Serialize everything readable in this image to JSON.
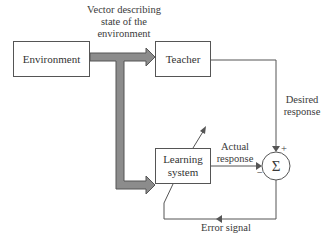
{
  "diagram": {
    "type": "block diagram",
    "blocks": {
      "environment": "Environment",
      "teacher": "Teacher",
      "learning_system_line1": "Learning",
      "learning_system_line2": "system",
      "summing_junction": "Σ"
    },
    "labels": {
      "vector_line1": "Vector describing",
      "vector_line2": "state of the",
      "vector_line3": "environment",
      "desired_line1": "Desired",
      "desired_line2": "response",
      "actual_line1": "Actual",
      "actual_line2": "response",
      "error_signal": "Error signal",
      "plus_sign": "+",
      "minus_sign": "−"
    },
    "colors": {
      "thick_arrow_fill": "#8c8c8c",
      "thick_arrow_stroke": "#555555",
      "line": "#555555"
    }
  }
}
